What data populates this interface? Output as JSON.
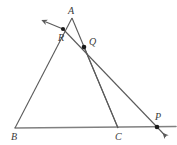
{
  "figure": {
    "kind": "geometry-diagram",
    "background_color": "#ffffff",
    "line_color": "#5a5a5a",
    "baseline_color": "#808080",
    "point_color": "#1a1a1a",
    "label_color": "#3a3a3a",
    "points": [
      {
        "id": "A",
        "label": "A",
        "x": 72,
        "y": 18,
        "label_x": 68,
        "label_y": 6,
        "dot": false
      },
      {
        "id": "B",
        "label": "B",
        "x": 15,
        "y": 128,
        "label_x": 11,
        "label_y": 132,
        "dot": false
      },
      {
        "id": "C",
        "label": "C",
        "x": 118,
        "y": 128,
        "label_x": 115,
        "label_y": 132,
        "dot": false
      },
      {
        "id": "R",
        "label": "R",
        "x": 63,
        "y": 29,
        "label_x": 58,
        "label_y": 33,
        "dot": true
      },
      {
        "id": "Q",
        "label": "Q",
        "x": 84,
        "y": 47,
        "label_x": 89,
        "label_y": 37,
        "dot": true
      },
      {
        "id": "P",
        "label": "P",
        "x": 157,
        "y": 127,
        "label_x": 155,
        "label_y": 112,
        "dot": true
      }
    ],
    "segments": [
      {
        "name": "side-AB",
        "from": "B",
        "to": "A"
      },
      {
        "name": "side-AC",
        "from": "A",
        "to": "C"
      },
      {
        "name": "side-BC",
        "from": "B",
        "to": "C"
      },
      {
        "name": "cevian-QC",
        "from": "Q",
        "to": "C"
      },
      {
        "name": "transversal-RP",
        "from": "R",
        "to": "P"
      }
    ],
    "rays": [
      {
        "name": "ray-BA-beyond-A",
        "label": "ray BA extended past R toward upper left",
        "arrow": true
      },
      {
        "name": "ray-BC-beyond-C",
        "label": "ray BC extended past C through P",
        "arrow": false
      },
      {
        "name": "ray-transversal-beyond-P",
        "label": "transversal extended past P",
        "arrow": true
      }
    ]
  }
}
